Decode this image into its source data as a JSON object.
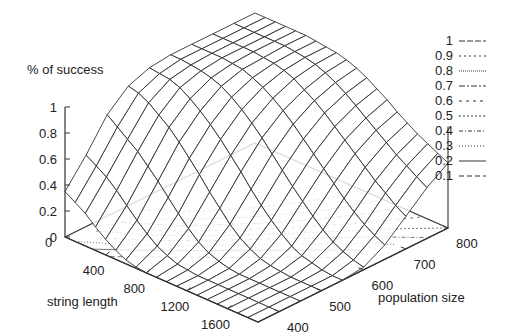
{
  "chart_data": {
    "type": "surface3d",
    "title": "",
    "zlabel": "% of success",
    "xlabel": "string length",
    "ylabel": "population size",
    "x_ticks": [
      400,
      800,
      1200,
      1600
    ],
    "y_ticks": [
      400,
      500,
      600,
      700,
      800
    ],
    "z_ticks": [
      "0",
      "0.2",
      "0.4",
      "0.6",
      "0.8",
      "1"
    ],
    "xlim": [
      0,
      1900
    ],
    "ylim": [
      350,
      800
    ],
    "zlim": [
      0,
      1
    ],
    "contour_levels": [
      "1",
      "0.9",
      "0.8",
      "0.7",
      "0.6",
      "0.5",
      "0.4",
      "0.3",
      "0.2",
      "0.1"
    ],
    "legend_position": "top-right",
    "grid": {
      "string_length": [
        0,
        100,
        200,
        300,
        400,
        500,
        600,
        700,
        800,
        900,
        1000,
        1100,
        1200,
        1300,
        1400,
        1500,
        1600,
        1700,
        1800,
        1900
      ],
      "population_size": [
        350,
        400,
        450,
        500,
        550,
        600,
        650,
        700,
        750,
        800
      ],
      "success": [
        [
          0.35,
          0.55,
          0.78,
          0.92,
          0.98,
          1.0,
          1.0,
          1.0,
          1.0,
          1.0
        ],
        [
          0.3,
          0.5,
          0.72,
          0.9,
          0.97,
          1.0,
          1.0,
          1.0,
          1.0,
          1.0
        ],
        [
          0.25,
          0.45,
          0.66,
          0.86,
          0.96,
          0.99,
          1.0,
          1.0,
          1.0,
          1.0
        ],
        [
          0.18,
          0.38,
          0.6,
          0.8,
          0.93,
          0.98,
          1.0,
          1.0,
          1.0,
          1.0
        ],
        [
          0.12,
          0.3,
          0.52,
          0.74,
          0.88,
          0.96,
          0.99,
          1.0,
          1.0,
          1.0
        ],
        [
          0.07,
          0.22,
          0.44,
          0.66,
          0.82,
          0.93,
          0.98,
          0.99,
          1.0,
          1.0
        ],
        [
          0.03,
          0.15,
          0.35,
          0.57,
          0.75,
          0.88,
          0.95,
          0.98,
          0.99,
          0.99
        ],
        [
          0.01,
          0.09,
          0.26,
          0.48,
          0.67,
          0.82,
          0.91,
          0.96,
          0.98,
          0.98
        ],
        [
          0.0,
          0.05,
          0.18,
          0.38,
          0.58,
          0.75,
          0.86,
          0.93,
          0.96,
          0.97
        ],
        [
          0.0,
          0.02,
          0.11,
          0.29,
          0.49,
          0.67,
          0.8,
          0.88,
          0.93,
          0.95
        ],
        [
          0.0,
          0.01,
          0.06,
          0.2,
          0.39,
          0.58,
          0.73,
          0.83,
          0.89,
          0.92
        ],
        [
          0.0,
          0.0,
          0.03,
          0.13,
          0.3,
          0.49,
          0.65,
          0.77,
          0.84,
          0.88
        ],
        [
          0.0,
          0.0,
          0.01,
          0.08,
          0.22,
          0.4,
          0.57,
          0.7,
          0.78,
          0.83
        ],
        [
          0.0,
          0.0,
          0.0,
          0.04,
          0.15,
          0.32,
          0.49,
          0.63,
          0.72,
          0.78
        ],
        [
          0.0,
          0.0,
          0.0,
          0.02,
          0.09,
          0.24,
          0.41,
          0.56,
          0.66,
          0.72
        ],
        [
          0.0,
          0.0,
          0.0,
          0.01,
          0.05,
          0.17,
          0.33,
          0.49,
          0.6,
          0.67
        ],
        [
          0.0,
          0.0,
          0.0,
          0.0,
          0.03,
          0.11,
          0.26,
          0.42,
          0.54,
          0.62
        ],
        [
          0.0,
          0.0,
          0.0,
          0.0,
          0.01,
          0.07,
          0.2,
          0.36,
          0.49,
          0.58
        ],
        [
          0.0,
          0.0,
          0.0,
          0.0,
          0.0,
          0.04,
          0.15,
          0.3,
          0.44,
          0.54
        ],
        [
          0.0,
          0.0,
          0.0,
          0.0,
          0.0,
          0.02,
          0.11,
          0.25,
          0.39,
          0.5
        ]
      ]
    }
  },
  "labels": {
    "zlabel": "% of success",
    "xlabel": "string length",
    "ylabel": "population size"
  },
  "colors": {
    "line": "#333333",
    "contour": "#555555",
    "background": "#ffffff"
  }
}
